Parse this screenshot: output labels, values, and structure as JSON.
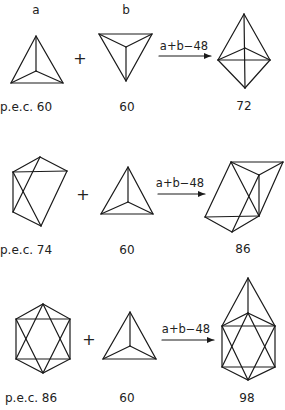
{
  "column_headers": {
    "a": "a",
    "b": "b"
  },
  "rows": [
    {
      "left_label": "p.e.c. 60",
      "operator": "+",
      "middle_label": "60",
      "reaction": "a+b−48",
      "result_label": "72"
    },
    {
      "left_label": "p.e.c.  74",
      "operator": "+",
      "middle_label": "60",
      "reaction": "a+b−48",
      "result_label": "86"
    },
    {
      "left_label": "p.e.c. 86",
      "operator": "+",
      "middle_label": "60",
      "reaction": "a+b−48",
      "result_label": "98"
    }
  ],
  "colors": {
    "line": "#1a1a1a",
    "text": "#222222",
    "background": "#ffffff"
  }
}
